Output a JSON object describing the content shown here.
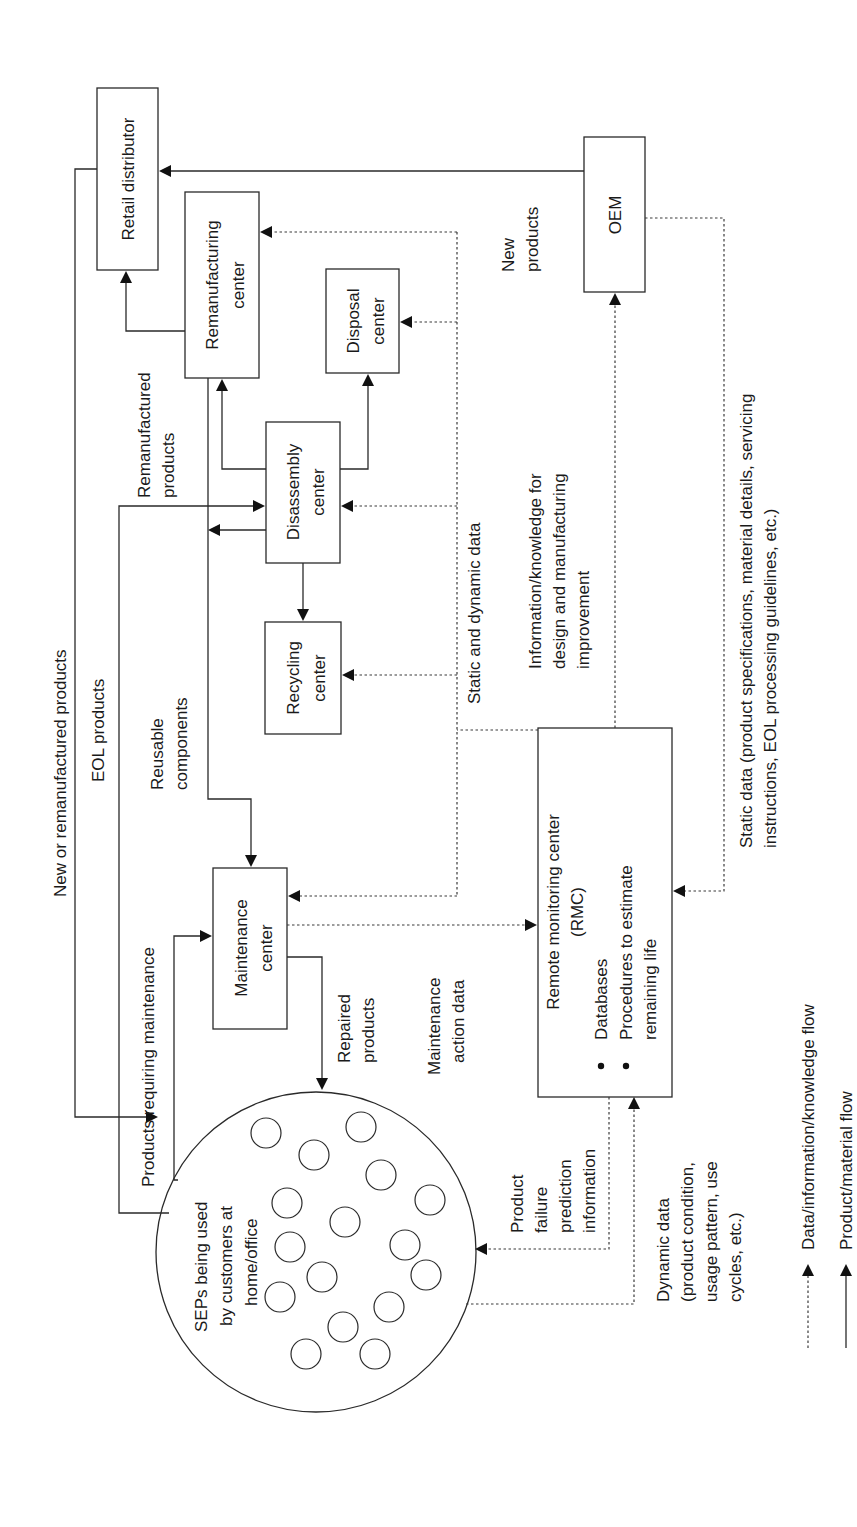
{
  "nodes": {
    "retail": "Retail distributor",
    "reman": [
      "Remanufacturing",
      "center"
    ],
    "disposal": [
      "Disposal",
      "center"
    ],
    "disassembly": [
      "Disassembly",
      "center"
    ],
    "recycling": [
      "Recycling",
      "center"
    ],
    "maintenance": [
      "Maintenance",
      "center"
    ],
    "oem": "OEM",
    "rmc": {
      "title": [
        "Remote monitoring center",
        "(RMC)"
      ],
      "bullets": [
        "Databases",
        "Procedures to estimate",
        "remaining life"
      ]
    },
    "seps": [
      "SEPs being used",
      "by customers at",
      "home/office"
    ]
  },
  "labels": {
    "new_or_reman": "New or remanufactured products",
    "eol": "EOL products",
    "reman_products": [
      "Remanufactured",
      "products"
    ],
    "reusable": [
      "Reusable",
      "components"
    ],
    "products_requiring": "Products requiring maintenance",
    "repaired": [
      "Repaired",
      "products"
    ],
    "maint_action": [
      "Maintenance",
      "action data"
    ],
    "static_dynamic": "Static and dynamic data",
    "info_knowledge": [
      "Information/knowledge for",
      "design and manufacturing",
      "improvement"
    ],
    "new_products": [
      "New",
      "products"
    ],
    "static_data": [
      "Static data (product specifications, material details, servicing",
      "instructions, EOL processing guidelines, etc.)"
    ],
    "failure_prediction": [
      "Product",
      "failure",
      "prediction",
      "information"
    ],
    "dynamic_data": [
      "Dynamic data",
      "(product condition,",
      "usage pattern, use",
      "cycles, etc.)"
    ]
  },
  "legend": {
    "data_flow": "Data/information/knowledge flow",
    "product_flow": "Product/material flow"
  }
}
